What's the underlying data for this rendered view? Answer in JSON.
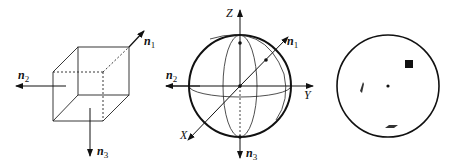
{
  "figure": {
    "panels": [
      {
        "id": "cube",
        "description": "Cube with three face normal vectors",
        "vectors": [
          {
            "name": "n",
            "subscript": "1",
            "direction": "up-right (diagonal)"
          },
          {
            "name": "n",
            "subscript": "2",
            "direction": "left"
          },
          {
            "name": "n",
            "subscript": "3",
            "direction": "down"
          }
        ]
      },
      {
        "id": "sphere",
        "description": "Reference sphere with coordinate axes and normals",
        "axes": [
          {
            "label": "Z",
            "direction": "up"
          },
          {
            "label": "Y",
            "direction": "right"
          },
          {
            "label": "X",
            "direction": "down-left"
          }
        ],
        "vectors": [
          {
            "name": "n",
            "subscript": "1"
          },
          {
            "name": "n",
            "subscript": "2"
          },
          {
            "name": "n",
            "subscript": "3"
          }
        ]
      },
      {
        "id": "projection",
        "description": "Stereographic projection with face poles",
        "markers": [
          "square",
          "parallelogram-left",
          "parallelogram-bottom",
          "center-dot"
        ]
      }
    ],
    "labels": {
      "cube_n1": "n",
      "cube_n1_sub": "1",
      "cube_n2": "n",
      "cube_n2_sub": "2",
      "cube_n3": "n",
      "cube_n3_sub": "3",
      "sph_z": "Z",
      "sph_y": "Y",
      "sph_x": "X",
      "sph_n1": "n",
      "sph_n1_sub": "1",
      "sph_n2": "n",
      "sph_n2_sub": "2",
      "sph_n3": "n",
      "sph_n3_sub": "3"
    },
    "colors": {
      "stroke": "#111111",
      "background": "#ffffff"
    }
  }
}
